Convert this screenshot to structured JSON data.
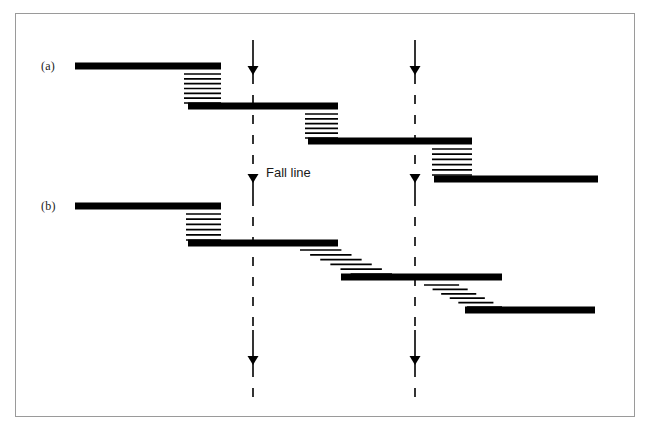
{
  "figure": {
    "title": "",
    "background_color": "#ffffff",
    "border_color": "#9a9a9a",
    "ink_color": "#000000",
    "width": 652,
    "height": 437
  },
  "labels": {
    "panel_a": "(a)",
    "panel_b": "(b)",
    "fall_line": "Fall line"
  },
  "chart_data": {
    "type": "diagram",
    "title": "",
    "xlabel": "",
    "ylabel": "",
    "fall_lines": [
      {
        "name": "fall-line-left",
        "x": 253,
        "solid_segments": [
          [
            40,
            75
          ],
          [
            183,
            197
          ],
          [
            330,
            368
          ]
        ],
        "dashed_segments": [
          [
            75,
            183
          ],
          [
            197,
            330
          ],
          [
            368,
            400
          ]
        ],
        "arrowheads_y": [
          75,
          183,
          365
        ]
      },
      {
        "name": "fall-line-right",
        "x": 415,
        "solid_segments": [
          [
            40,
            75
          ],
          [
            183,
            197
          ],
          [
            330,
            368
          ]
        ],
        "dashed_segments": [
          [
            75,
            183
          ],
          [
            197,
            330
          ],
          [
            368,
            400
          ]
        ],
        "arrowheads_y": [
          75,
          183,
          365
        ]
      }
    ],
    "panels": [
      {
        "id": "a",
        "label": "(a)",
        "label_x": 41,
        "label_y": 65,
        "hatch_style": "flush",
        "bars": [
          {
            "x1": 75,
            "x2": 221,
            "y": 66,
            "thickness": 7
          },
          {
            "x1": 188,
            "x2": 338,
            "y": 106,
            "thickness": 7
          },
          {
            "x1": 308,
            "x2": 472,
            "y": 141,
            "thickness": 7
          },
          {
            "x1": 434,
            "x2": 598,
            "y": 179,
            "thickness": 7
          }
        ],
        "hatch_zones": [
          {
            "x1": 184,
            "x2": 221,
            "y1": 74,
            "y2": 103,
            "lines": 7,
            "style": "flush"
          },
          {
            "x1": 305,
            "x2": 338,
            "y1": 114,
            "y2": 138,
            "lines": 6,
            "style": "flush"
          },
          {
            "x1": 432,
            "x2": 472,
            "y1": 149,
            "y2": 175,
            "lines": 6,
            "style": "flush"
          }
        ]
      },
      {
        "id": "b",
        "label": "(b)",
        "label_x": 41,
        "label_y": 205,
        "hatch_style": "staircase",
        "bars": [
          {
            "x1": 75,
            "x2": 221,
            "y": 206,
            "thickness": 7
          },
          {
            "x1": 188,
            "x2": 338,
            "y": 243,
            "thickness": 7
          },
          {
            "x1": 341,
            "x2": 502,
            "y": 277,
            "thickness": 7
          },
          {
            "x1": 465,
            "x2": 595,
            "y": 310,
            "thickness": 7
          }
        ],
        "hatch_zones": [
          {
            "x1": 186,
            "x2": 221,
            "y1": 214,
            "y2": 240,
            "lines": 6,
            "style": "flush"
          },
          {
            "x1": 300,
            "x2": 392,
            "y1": 250,
            "y2": 274,
            "lines": 6,
            "style": "staircase"
          },
          {
            "x1": 424,
            "x2": 502,
            "y1": 285,
            "y2": 307,
            "lines": 6,
            "style": "staircase"
          }
        ]
      }
    ],
    "legend": [],
    "grid": false
  }
}
